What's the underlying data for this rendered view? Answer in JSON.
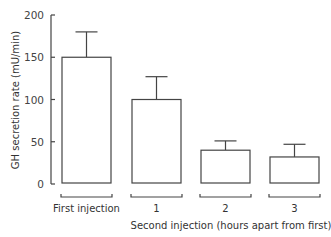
{
  "chart_data": {
    "type": "bar",
    "title": "",
    "xlabel": "Second injection (hours apart from first)",
    "ylabel": "GH secretion rate (mU/min)",
    "ylim": [
      0,
      200
    ],
    "yticks": [
      0,
      50,
      100,
      150,
      200
    ],
    "grid": false,
    "legend": null,
    "categories": [
      "First injection",
      "1",
      "2",
      "3"
    ],
    "values": [
      150,
      100,
      40,
      32
    ],
    "error_upper": [
      180,
      127,
      51,
      47
    ],
    "error_bars": "upper only (mean + SE)",
    "bar_fill": "#ffffff",
    "bar_stroke": "#444444"
  },
  "axis": {
    "ytick_labels": [
      "0",
      "50",
      "100",
      "150",
      "200"
    ]
  }
}
